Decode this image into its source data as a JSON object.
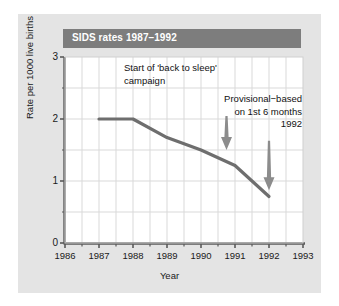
{
  "figure": {
    "title": "SIDS rates 1987–1992",
    "panel_bg": "#e4e4e4",
    "title_bar_color": "#7d7d7d",
    "title_text_color": "#ffffff",
    "plot_bg": "#ffffff",
    "line_color": "#6e6e6e",
    "grid_color": "#d9d9d9",
    "axis_color": "#5a5a5a",
    "arrow_color": "#8c8c8c"
  },
  "chart_data": {
    "type": "line",
    "title": "SIDS rates 1987–1992",
    "xlabel": "Year",
    "ylabel": "Rate per 1000 live births",
    "xlim": [
      1986,
      1993
    ],
    "ylim": [
      0,
      3
    ],
    "grid": true,
    "legend": "none",
    "xticks": [
      1986,
      1987,
      1988,
      1989,
      1990,
      1991,
      1992,
      1993
    ],
    "xtick_labels": [
      "1986",
      "1987",
      "1988",
      "1989",
      "1990",
      "1991",
      "1992",
      "1993"
    ],
    "yticks": [
      0,
      1,
      2,
      3
    ],
    "ytick_labels": [
      "0",
      "1",
      "2",
      "3"
    ],
    "y_minor_ticks": [
      0.5,
      1.5,
      2.5
    ],
    "x_minor_ticks": [
      1986.5,
      1987.5,
      1988.5,
      1989.5,
      1990.5,
      1991.5,
      1992.5
    ],
    "x": [
      1987,
      1988,
      1989,
      1990,
      1991,
      1992
    ],
    "values": [
      2.0,
      2.0,
      1.7,
      1.5,
      1.25,
      0.75
    ],
    "series": [
      {
        "name": "SIDS rate",
        "values": [
          2.0,
          2.0,
          1.7,
          1.5,
          1.25,
          0.75
        ]
      }
    ],
    "annotations": [
      {
        "id": "back-to-sleep",
        "lines": [
          "Start of 'back to sleep'",
          "campaign"
        ],
        "text": "Start of 'back to sleep' campaign",
        "arrow_x": 1990.75,
        "arrow_from_y": 2.05,
        "arrow_to_y": 1.5
      },
      {
        "id": "provisional",
        "lines": [
          "Provisional−based",
          "on 1st 6 months",
          "1992"
        ],
        "text": "Provisional−based on 1st 6 months 1992",
        "arrow_x": 1992.0,
        "arrow_from_y": 1.65,
        "arrow_to_y": 0.85
      }
    ]
  },
  "axis": {
    "ytick_labels": [
      "3",
      "2",
      "1",
      "0"
    ],
    "xtick_labels": [
      "1986",
      "1987",
      "1988",
      "1989",
      "1990",
      "1991",
      "1992",
      "1993"
    ],
    "xlabel": "Year",
    "ylabel": "Rate per 1000 live births"
  },
  "annotations": {
    "a1_line1": "Start of 'back to sleep'",
    "a1_line2": "campaign",
    "a2_line1": "Provisional−based",
    "a2_line2": "on 1st 6 months",
    "a2_line3": "1992"
  }
}
